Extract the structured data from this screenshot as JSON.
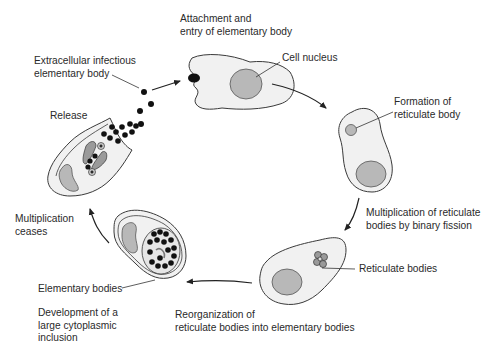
{
  "diagram": {
    "type": "life-cycle",
    "colors": {
      "cell_fill": "#f1f1f1",
      "cell_outline": "#3a3a3a",
      "nucleus_fill": "#b8b8b8",
      "body_fill": "#111111",
      "text": "#2a2a2a",
      "background": "#ffffff"
    },
    "stages": [
      {
        "id": "attachment",
        "label_lines": [
          "Attachment and",
          "entry of elementary body"
        ]
      },
      {
        "id": "formation",
        "label_lines": [
          "Formation of",
          "reticulate body"
        ]
      },
      {
        "id": "multiplication",
        "label_lines": [
          "Multiplication of reticulate",
          "bodies by binary fission"
        ]
      },
      {
        "id": "reorganization",
        "label_lines": [
          "Reorganization of",
          "reticulate bodies into elementary bodies"
        ]
      },
      {
        "id": "development",
        "label_lines": [
          "Development of a",
          "large cytoplasmic",
          "inclusion"
        ]
      },
      {
        "id": "ceases",
        "label_lines": [
          "Multiplication",
          "ceases"
        ]
      },
      {
        "id": "release",
        "label_lines": [
          "Release"
        ]
      }
    ],
    "callouts": {
      "extracellular": [
        "Extracellular infectious",
        "elementary body"
      ],
      "cell_nucleus": "Cell nucleus",
      "reticulate_bodies": "Reticulate bodies",
      "elementary_bodies": "Elementary bodies"
    }
  }
}
